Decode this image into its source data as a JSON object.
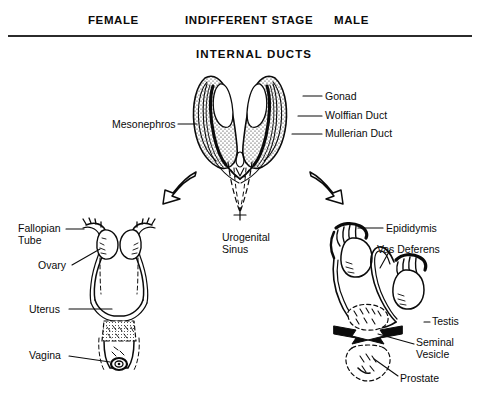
{
  "figure": {
    "section_title": "INTERNAL DUCTS",
    "headers": {
      "female": "FEMALE",
      "indifferent": "INDIFFERENT STAGE",
      "male": "MALE"
    },
    "colors": {
      "ink": "#0b0b0b",
      "rule": "#2b2b2b",
      "background": "#ffffff",
      "stipple": "#1a1a1a"
    }
  },
  "indifferent_stage": {
    "labels": {
      "mesonephros": "Mesonephros",
      "gonad": "Gonad",
      "wolffian_duct": "Wolffian Duct",
      "mullerian_duct": "Mullerian Duct",
      "urogenital_sinus": "Urogenital\nSinus"
    }
  },
  "female_stage": {
    "labels": {
      "fallopian_tube": "Fallopian\nTube",
      "ovary": "Ovary",
      "uterus": "Uterus",
      "vagina": "Vagina"
    }
  },
  "male_stage": {
    "labels": {
      "epididymis": "Epididymis",
      "vas_deferens": "Vas Deferens",
      "testis": "Testis",
      "seminal_vesicle": "Seminal\nVesicle",
      "prostate": "Prostate"
    }
  },
  "arrows": {
    "to_female": "curved-arrow-down-left-icon",
    "to_male": "curved-arrow-down-right-icon"
  }
}
